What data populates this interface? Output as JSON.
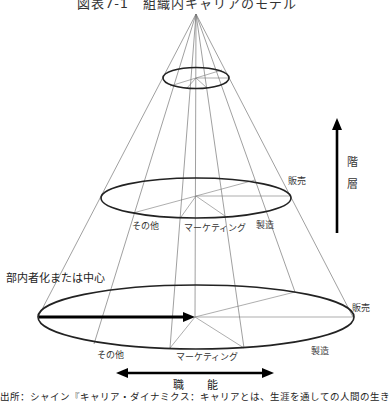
{
  "title": "図表7-1　組織内キャリアのモデル",
  "axes": {
    "vertical_label": [
      "階",
      "層"
    ],
    "horizontal_label": "職　能"
  },
  "labels": {
    "center": "部内者化または中心",
    "middle_ring": {
      "sales": "販売",
      "other": "その他",
      "marketing": "マーケティング",
      "manufacturing": "製造"
    },
    "bottom_ring": {
      "sales": "販売",
      "other": "その他",
      "marketing": "マーケティング",
      "manufacturing": "製造"
    }
  },
  "source": "出所：シャイン『キャリア・ダイナミクス：キャリアとは、生涯を通しての人間の生き"
}
